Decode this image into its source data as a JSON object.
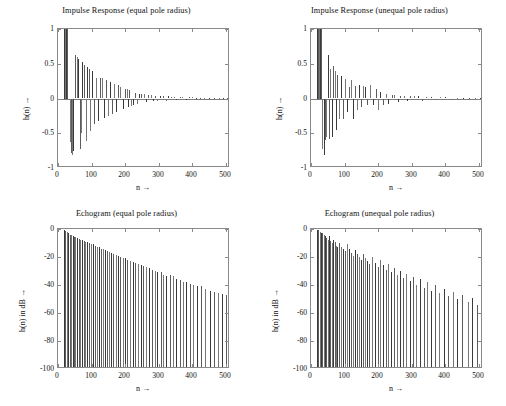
{
  "figure": {
    "background": "#ffffff",
    "line_color": "#4a4a4a",
    "axis_color": "#8a8a8a",
    "text_color": "#111111",
    "width": 506,
    "height": 406
  },
  "panels": [
    {
      "key": "impulse_equal",
      "title": "Impulse Response (equal pole radius)",
      "xlabel": "n →",
      "ylabel": "h(n) →",
      "xticks": [
        "0",
        "100",
        "200",
        "300",
        "400",
        "500"
      ],
      "yticks": [
        "1",
        "0.5",
        "0",
        "-0.5",
        "-1"
      ]
    },
    {
      "key": "impulse_unequal",
      "title": "Impulse Response (unequal pole radius)",
      "xlabel": "n →",
      "ylabel": "h(n) →",
      "xticks": [
        "0",
        "100",
        "200",
        "300",
        "400",
        "500"
      ],
      "yticks": [
        "1",
        "0.5",
        "0",
        "-0.5",
        "-1"
      ]
    },
    {
      "key": "echogram_equal",
      "title": "Echogram (equal pole radius)",
      "xlabel": "n →",
      "ylabel": "h(n)  in dB →",
      "xticks": [
        "0",
        "100",
        "200",
        "300",
        "400",
        "500"
      ],
      "yticks": [
        "0",
        "-20",
        "-40",
        "-60",
        "-80",
        "-100"
      ]
    },
    {
      "key": "echogram_unequal",
      "title": "Echogram (unequal pole radius)",
      "xlabel": "n →",
      "ylabel": "h(n)  in dB →",
      "xticks": [
        "0",
        "100",
        "200",
        "300",
        "400",
        "500"
      ],
      "yticks": [
        "0",
        "-20",
        "-40",
        "-60",
        "-80",
        "-100"
      ]
    }
  ],
  "chart_data": [
    {
      "type": "stem",
      "key": "impulse_equal",
      "title": "Impulse Response (equal pole radius)",
      "xlabel": "n →",
      "ylabel": "h(n) →",
      "xlim": [
        0,
        512
      ],
      "ylim": [
        -1,
        1
      ],
      "xticks": [
        0,
        100,
        200,
        300,
        400,
        500
      ],
      "yticks": [
        -1,
        -0.5,
        0,
        0.5,
        1
      ],
      "grid": false,
      "legend": null,
      "x": [
        18,
        20,
        22,
        24,
        26,
        36,
        38,
        40,
        42,
        46,
        52,
        56,
        60,
        64,
        68,
        72,
        76,
        82,
        86,
        92,
        96,
        102,
        106,
        112,
        118,
        124,
        130,
        136,
        142,
        148,
        154,
        160,
        166,
        172,
        178,
        186,
        192,
        198,
        204,
        208,
        212,
        218,
        224,
        230,
        236,
        242,
        248,
        256,
        262,
        268,
        276,
        282,
        290,
        296,
        304,
        312,
        320,
        328,
        336,
        344,
        352,
        362,
        370,
        380,
        390,
        400,
        412,
        424,
        436,
        450,
        464,
        478,
        492,
        504
      ],
      "y": [
        1.0,
        1.0,
        1.0,
        1.0,
        1.0,
        -0.62,
        -0.72,
        -0.79,
        -0.81,
        -0.76,
        0.63,
        0.6,
        0.57,
        -0.73,
        -0.5,
        0.52,
        0.48,
        -0.61,
        0.45,
        0.42,
        -0.47,
        0.4,
        -0.36,
        0.3,
        -0.33,
        0.29,
        0.3,
        -0.28,
        0.26,
        -0.25,
        0.24,
        -0.22,
        0.21,
        -0.2,
        0.19,
        0.16,
        -0.15,
        0.14,
        0.13,
        -0.12,
        0.12,
        -0.11,
        -0.09,
        0.08,
        -0.08,
        0.07,
        0.06,
        0.06,
        -0.05,
        0.05,
        0.05,
        -0.04,
        0.04,
        -0.04,
        0.03,
        0.03,
        -0.03,
        0.03,
        0.02,
        0.02,
        -0.02,
        0.02,
        0.02,
        -0.02,
        0.015,
        0.015,
        0.012,
        0.012,
        0.01,
        0.01,
        0.008,
        0.008,
        0.006,
        0.005
      ]
    },
    {
      "type": "stem",
      "key": "impulse_unequal",
      "title": "Impulse Response (unequal pole radius)",
      "xlabel": "n →",
      "ylabel": "h(n) →",
      "xlim": [
        0,
        512
      ],
      "ylim": [
        -1,
        1
      ],
      "xticks": [
        0,
        100,
        200,
        300,
        400,
        500
      ],
      "yticks": [
        -1,
        -0.5,
        0,
        0.5,
        1
      ],
      "grid": false,
      "legend": null,
      "x": [
        18,
        21,
        24,
        27,
        30,
        34,
        38,
        42,
        46,
        50,
        54,
        58,
        62,
        66,
        70,
        74,
        78,
        84,
        88,
        94,
        100,
        106,
        112,
        118,
        124,
        130,
        136,
        142,
        148,
        154,
        162,
        168,
        176,
        184,
        192,
        198,
        206,
        214,
        222,
        230,
        240,
        248,
        258,
        266,
        276,
        286,
        296,
        306,
        318,
        330,
        342,
        356,
        370,
        384,
        400,
        416,
        434,
        452,
        470,
        488,
        504
      ],
      "y": [
        1.0,
        1.0,
        1.0,
        1.0,
        1.0,
        -0.72,
        -0.81,
        -0.6,
        -0.55,
        0.63,
        -0.58,
        0.42,
        -0.56,
        0.47,
        0.39,
        -0.45,
        0.34,
        -0.3,
        0.33,
        -0.3,
        0.28,
        -0.2,
        0.17,
        0.26,
        -0.3,
        0.18,
        -0.16,
        0.2,
        -0.12,
        0.18,
        0.16,
        -0.1,
        0.2,
        -0.09,
        0.14,
        -0.17,
        0.1,
        -0.1,
        0.06,
        -0.08,
        0.05,
        0.05,
        -0.05,
        0.04,
        0.04,
        -0.04,
        0.03,
        0.03,
        0.03,
        -0.03,
        0.02,
        0.02,
        -0.02,
        0.02,
        0.02,
        -0.015,
        0.012,
        0.012,
        0.01,
        0.008,
        0.006
      ]
    },
    {
      "type": "stem",
      "key": "echogram_equal",
      "title": "Echogram (equal pole radius)",
      "xlabel": "n →",
      "ylabel": "h(n)  in dB →",
      "xlim": [
        0,
        512
      ],
      "ylim": [
        -100,
        0
      ],
      "xticks": [
        0,
        100,
        200,
        300,
        400,
        500
      ],
      "yticks": [
        -100,
        -80,
        -60,
        -40,
        -20,
        0
      ],
      "grid": false,
      "legend": null,
      "note": "each stem drawn from -100 dB baseline up to its dB value; envelope decays roughly linearly from 0 dB to about -48 dB at n=500",
      "x": [
        18,
        22,
        26,
        30,
        36,
        40,
        44,
        48,
        52,
        58,
        62,
        66,
        70,
        76,
        80,
        86,
        92,
        98,
        104,
        110,
        116,
        122,
        128,
        134,
        140,
        146,
        152,
        158,
        164,
        172,
        178,
        186,
        192,
        200,
        206,
        214,
        222,
        230,
        238,
        246,
        254,
        262,
        270,
        280,
        288,
        296,
        306,
        314,
        322,
        332,
        342,
        352,
        362,
        372,
        382,
        392,
        402,
        414,
        426,
        438,
        452,
        464,
        476,
        488,
        500,
        508
      ],
      "y": [
        -0.5,
        -1.5,
        -2.0,
        -3.0,
        -4.0,
        -4.5,
        -5.0,
        -5.5,
        -6.0,
        -6.5,
        -7.0,
        -7.5,
        -8.0,
        -8.5,
        -9.0,
        -9.5,
        -10.0,
        -10.5,
        -11.0,
        -12.0,
        -12.5,
        -13.0,
        -14.0,
        -14.5,
        -15.0,
        -16.0,
        -16.5,
        -17.0,
        -18.0,
        -18.5,
        -19.0,
        -20.0,
        -20.5,
        -21.0,
        -22.0,
        -23.0,
        -23.5,
        -24.0,
        -25.0,
        -26.0,
        -26.5,
        -27.0,
        -28.0,
        -29.0,
        -30.0,
        -30.5,
        -31.0,
        -33.0,
        -33.5,
        -33.0,
        -33.5,
        -36.0,
        -36.5,
        -37.5,
        -38.0,
        -39.0,
        -40.0,
        -40.5,
        -41.0,
        -43.0,
        -44.0,
        -45.0,
        -46.0,
        -46.5,
        -47.0,
        -48.0
      ]
    },
    {
      "type": "stem",
      "key": "echogram_unequal",
      "title": "Echogram (unequal pole radius)",
      "xlabel": "n →",
      "ylabel": "h(n)  in dB →",
      "xlim": [
        0,
        512
      ],
      "ylim": [
        -100,
        0
      ],
      "xticks": [
        0,
        100,
        200,
        300,
        400,
        500
      ],
      "yticks": [
        -100,
        -80,
        -60,
        -40,
        -20,
        0
      ],
      "grid": false,
      "legend": null,
      "note": "stems from -100 dB baseline; spread of values is wider than the equal-radius case, envelope reaching about -55 dB at n=500",
      "x": [
        18,
        22,
        26,
        30,
        34,
        38,
        42,
        46,
        50,
        54,
        58,
        62,
        66,
        70,
        74,
        78,
        84,
        88,
        94,
        100,
        106,
        112,
        118,
        124,
        130,
        136,
        142,
        148,
        154,
        160,
        168,
        174,
        182,
        190,
        198,
        206,
        214,
        222,
        230,
        238,
        248,
        256,
        266,
        274,
        284,
        294,
        304,
        314,
        324,
        336,
        346,
        358,
        370,
        382,
        396,
        408,
        422,
        436,
        450,
        466,
        480,
        494,
        506
      ],
      "y": [
        -0.5,
        -1.0,
        -2.0,
        -2.5,
        -3.0,
        -4.0,
        -5.0,
        -6.5,
        -7.5,
        -5.0,
        -8.5,
        -10.0,
        -8.0,
        -9.5,
        -12.0,
        -13.0,
        -10.0,
        -12.5,
        -14.0,
        -16.0,
        -11.0,
        -14.0,
        -17.0,
        -19.0,
        -15.0,
        -17.5,
        -20.0,
        -22.0,
        -18.0,
        -21.0,
        -23.0,
        -25.0,
        -20.0,
        -24.0,
        -27.0,
        -22.0,
        -26.0,
        -29.0,
        -25.0,
        -31.0,
        -28.0,
        -33.0,
        -30.0,
        -35.0,
        -32.0,
        -37.0,
        -34.0,
        -40.0,
        -36.0,
        -42.0,
        -38.0,
        -44.0,
        -40.0,
        -46.0,
        -43.0,
        -48.0,
        -45.0,
        -50.0,
        -47.0,
        -52.0,
        -49.0,
        -54.0,
        -55.0
      ]
    }
  ]
}
